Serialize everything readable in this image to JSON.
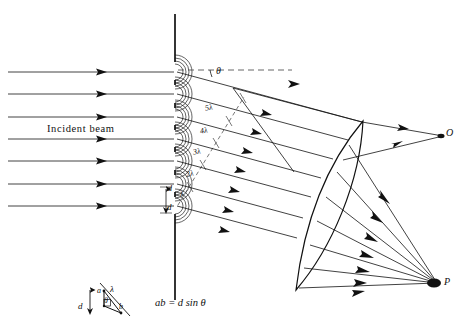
{
  "figure": {
    "background_color": "#ffffff",
    "line_color": "#111111",
    "dashed_color": "#555555"
  },
  "labels": {
    "incident_beam": "Incident beam",
    "theta": "θ",
    "point_O": "O",
    "point_P": "P",
    "slit_spacing": "d",
    "slit_spacing_upper": "d"
  },
  "path_differences": [
    {
      "id": "one",
      "text": "λ"
    },
    {
      "id": "two",
      "text": "2λ"
    },
    {
      "id": "three",
      "text": "3λ"
    },
    {
      "id": "four",
      "text": "4λ"
    },
    {
      "id": "five",
      "text": "5λ"
    }
  ],
  "inset": {
    "vertex_a": "a",
    "vertex_b": "b",
    "spacing": "d",
    "wavelength": "λ",
    "angle": "θ",
    "formula": "ab = d sin θ"
  },
  "geometry": {
    "grating_x": 175,
    "num_slits": 7,
    "num_incident_rays": 7,
    "slit_y": [
      72,
      94,
      117,
      139,
      161,
      184,
      206
    ],
    "diffraction_angle_deg": 11,
    "focus_O": {
      "x": 443,
      "y": 136
    },
    "focus_P": {
      "x": 437,
      "y": 283
    }
  }
}
